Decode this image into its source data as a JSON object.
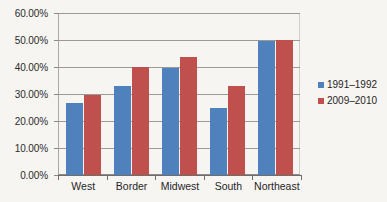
{
  "chart_data": {
    "type": "bar",
    "title": "",
    "subtitle": "",
    "xlabel": "",
    "ylabel": "",
    "grid": true,
    "legend_position": "right",
    "categories": [
      "West",
      "Border",
      "Midwest",
      "South",
      "Northeast"
    ],
    "ylim": [
      0,
      60
    ],
    "y_ticks": [
      0,
      10,
      20,
      30,
      40,
      50,
      60
    ],
    "y_tick_labels": [
      "0.00%",
      "10.00%",
      "20.00%",
      "30.00%",
      "40.00%",
      "50.00%",
      "60.00%"
    ],
    "series": [
      {
        "name": "1991–1992",
        "color": "#4f81bd",
        "values": [
          26.5,
          33.0,
          39.7,
          25.0,
          49.5
        ]
      },
      {
        "name": "2009–2010",
        "color": "#c0504d",
        "values": [
          29.5,
          40.0,
          43.8,
          33.0,
          50.0
        ]
      }
    ]
  },
  "colors": {
    "series_1": "#4f81bd",
    "series_2": "#c0504d",
    "gridline": "#9a9a9a",
    "axis": "#6e6e6e",
    "text": "#1f1f1f",
    "background": "#f7f5f2"
  }
}
